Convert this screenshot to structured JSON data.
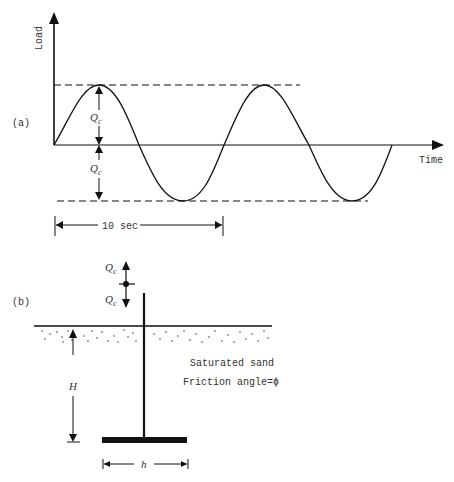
{
  "figure": {
    "panel_a": {
      "label": "(a)",
      "y_axis_label": "Load",
      "x_axis_label": "Time",
      "amplitude_label_top": "Q",
      "amplitude_label_bottom": "Q",
      "amplitude_subscript": "c",
      "period_label": "10 sec"
    },
    "panel_b": {
      "label": "(b)",
      "load_up_label": "Q",
      "load_down_label": "Q",
      "load_subscript": "c",
      "soil_label": "Saturated sand",
      "friction_label": "Friction angle=ϕ",
      "depth_label": "H",
      "width_label": "h"
    },
    "colors": {
      "ink": "#111111",
      "text": "#333333",
      "background": "#ffffff"
    }
  }
}
